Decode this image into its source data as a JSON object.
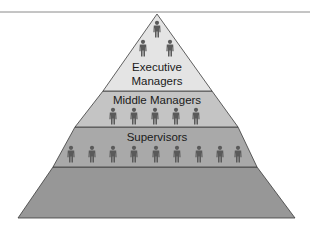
{
  "diagram": {
    "type": "hierarchy-pyramid",
    "top_rule_color": "#8a8a8a",
    "outline_color": "#3a3a3a",
    "person_color": "#5a5a5a",
    "layers": [
      {
        "id": "executive",
        "label_lines": [
          "Executive",
          "Managers"
        ],
        "fill": "#e4e4e4",
        "people_count": 3
      },
      {
        "id": "middle",
        "label_lines": [
          "Middle Managers"
        ],
        "fill": "#c4c4c4",
        "people_count": 5
      },
      {
        "id": "supervisors",
        "label_lines": [
          "Supervisors"
        ],
        "fill": "#a9a9a9",
        "people_count": 9
      },
      {
        "id": "base",
        "label_lines": [],
        "fill": "#979797",
        "people_count": 0
      }
    ]
  }
}
